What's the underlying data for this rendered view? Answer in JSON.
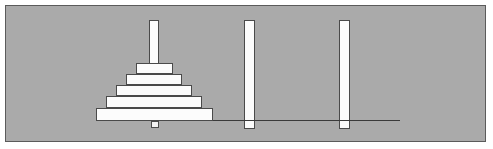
{
  "app": {
    "title": "Towers of Hanoi",
    "canvas_width": 493,
    "canvas_height": 149
  },
  "colors": {
    "page_background": "#ffffff",
    "canvas_background": "#aaaaaa",
    "frame_border": "#5b5b5b",
    "ground_line": "#3a3a3a",
    "piece_fill": "#fcfcfc",
    "piece_border": "#4a4a4a"
  },
  "scene": {
    "ground": {
      "label": "ground-line",
      "x": 90,
      "y": 114,
      "width": 304,
      "height": 1
    },
    "pegs": [
      {
        "id": "peg-1",
        "label": "Peg A",
        "x": 143,
        "y": 14,
        "width": 10,
        "height": 101,
        "disk_count": 5,
        "stub": {
          "x": 145,
          "y": 115,
          "width": 8,
          "height": 7
        }
      },
      {
        "id": "peg-2",
        "label": "Peg B",
        "x": 238,
        "y": 14,
        "width": 11,
        "height": 109,
        "disk_count": 0,
        "stub": null
      },
      {
        "id": "peg-3",
        "label": "Peg C",
        "x": 333,
        "y": 14,
        "width": 11,
        "height": 109,
        "disk_count": 0,
        "stub": null
      }
    ],
    "disks": [
      {
        "id": "disk-1",
        "size": 1,
        "peg": "peg-1",
        "stack_index": 4,
        "x": 130,
        "y": 57,
        "width": 37,
        "height": 11
      },
      {
        "id": "disk-2",
        "size": 2,
        "peg": "peg-1",
        "stack_index": 3,
        "x": 120,
        "y": 68,
        "width": 56,
        "height": 11
      },
      {
        "id": "disk-3",
        "size": 3,
        "peg": "peg-1",
        "stack_index": 2,
        "x": 110,
        "y": 79,
        "width": 76,
        "height": 11
      },
      {
        "id": "disk-4",
        "size": 4,
        "peg": "peg-1",
        "stack_index": 1,
        "x": 100,
        "y": 90,
        "width": 96,
        "height": 12
      },
      {
        "id": "disk-5",
        "size": 5,
        "peg": "peg-1",
        "stack_index": 0,
        "x": 90,
        "y": 102,
        "width": 117,
        "height": 13
      }
    ]
  }
}
